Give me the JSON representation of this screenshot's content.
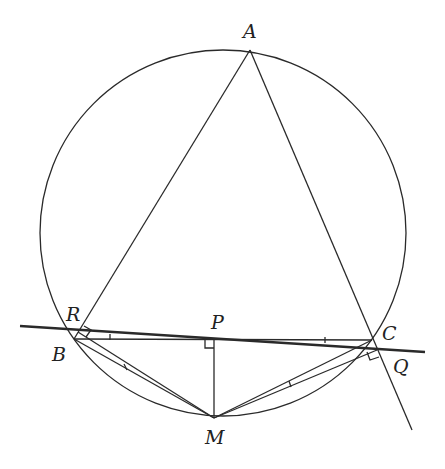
{
  "diagram": {
    "circle": {
      "cx": 223,
      "cy": 233,
      "r": 183
    },
    "points": {
      "A": {
        "x": 250,
        "y": 50
      },
      "B": {
        "x": 74,
        "y": 339
      },
      "C": {
        "x": 372,
        "y": 340
      },
      "M": {
        "x": 214,
        "y": 418
      },
      "P": {
        "x": 214,
        "y": 340
      },
      "R": {
        "x": 78,
        "y": 332
      },
      "Q": {
        "x": 377,
        "y": 350
      }
    },
    "labels": [
      {
        "id": "A",
        "text": "A",
        "x": 243,
        "y": 22
      },
      {
        "id": "R",
        "text": "R",
        "x": 66,
        "y": 305
      },
      {
        "id": "B",
        "text": "B",
        "x": 52,
        "y": 345
      },
      {
        "id": "P",
        "text": "P",
        "x": 211,
        "y": 313
      },
      {
        "id": "C",
        "text": "C",
        "x": 382,
        "y": 324
      },
      {
        "id": "Q",
        "text": "Q",
        "x": 393,
        "y": 357
      },
      {
        "id": "M",
        "text": "M",
        "x": 205,
        "y": 428
      }
    ],
    "simson_line": {
      "x1": 20,
      "y1": 326,
      "x2": 425,
      "y2": 352
    }
  }
}
